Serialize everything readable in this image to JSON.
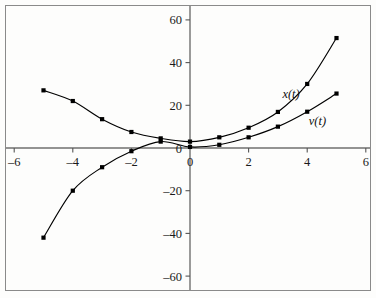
{
  "chart_data": {
    "type": "line",
    "title": "",
    "xlabel": "",
    "ylabel": "",
    "xlim": [
      -6.4,
      6.2
    ],
    "ylim": [
      -67,
      66
    ],
    "grid": false,
    "legend_position": "inline-curve-labels",
    "xticks": [
      -6,
      -4,
      -2,
      0,
      2,
      4,
      6
    ],
    "xtick_labels": [
      "–6",
      "–4",
      "–2",
      "0",
      "2",
      "4",
      "6"
    ],
    "yticks": [
      -60,
      -40,
      -20,
      0,
      20,
      40,
      60
    ],
    "ytick_labels": [
      "–60",
      "–40",
      "–20",
      "0",
      "20",
      "40",
      "60"
    ],
    "x": [
      -5,
      -4,
      -3,
      -2,
      -1,
      0,
      1,
      2,
      3,
      4,
      5
    ],
    "series": [
      {
        "name": "x(t)",
        "label": "x(t)",
        "marker": "square",
        "color": "#000000",
        "values": [
          27,
          22,
          13.5,
          7.5,
          4.5,
          3,
          5,
          9.5,
          16.9,
          30,
          51.5
        ]
      },
      {
        "name": "v(t)",
        "label": "v(t)",
        "marker": "square",
        "color": "#000000",
        "values": [
          -42,
          -20,
          -9,
          -1.5,
          3,
          0.5,
          1.5,
          5,
          10,
          17,
          25.5
        ]
      }
    ],
    "annotations": [
      {
        "text": "x(t)",
        "x": 3.45,
        "y": 23.5
      },
      {
        "text": "v(t)",
        "x": 4.35,
        "y": 11.0
      }
    ]
  },
  "axes": {
    "x_axis_name": "horizontal-axis",
    "y_axis_name": "vertical-axis"
  }
}
